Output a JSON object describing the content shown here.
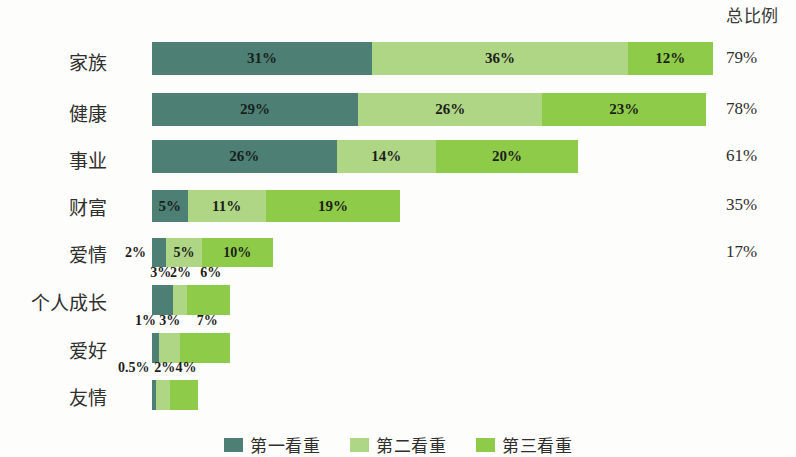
{
  "totals_header": "总比例",
  "colors": {
    "series1": "#4e7f74",
    "series2": "#aed685",
    "series3": "#8ecb49",
    "background": "#fdfdfc",
    "text": "#231f20"
  },
  "legend": [
    {
      "label": "第一看重",
      "color": "#4e7f74"
    },
    {
      "label": "第二看重",
      "color": "#aed685"
    },
    {
      "label": "第三看重",
      "color": "#8ecb49"
    }
  ],
  "rows": [
    {
      "label": "家族",
      "v1": "31%",
      "v2": "36%",
      "v3": "12%",
      "total": "79%",
      "labels_inside": true
    },
    {
      "label": "健康",
      "v1": "29%",
      "v2": "26%",
      "v3": "23%",
      "total": "78%",
      "labels_inside": true
    },
    {
      "label": "事业",
      "v1": "26%",
      "v2": "14%",
      "v3": "20%",
      "total": "61%",
      "labels_inside": true
    },
    {
      "label": "财富",
      "v1": "5%",
      "v2": "11%",
      "v3": "19%",
      "total": "35%",
      "labels_inside": true
    },
    {
      "label": "爱情",
      "v1": "2%",
      "v2": "5%",
      "v3": "10%",
      "total": "17%",
      "labels_inside": false
    },
    {
      "label": "个人成长",
      "v1": "3%",
      "v2": "2%",
      "v3": "6%",
      "total": "",
      "labels_inside": false
    },
    {
      "label": "爱好",
      "v1": "1%",
      "v2": "3%",
      "v3": "7%",
      "total": "",
      "labels_inside": false
    },
    {
      "label": "友情",
      "v1": "0.5%",
      "v2": "2%",
      "v3": "4%",
      "total": "",
      "labels_inside": false
    }
  ],
  "chart_data": {
    "type": "bar",
    "subtype": "stacked-horizontal",
    "title": "",
    "xlabel": "",
    "ylabel": "",
    "grid": false,
    "legend_position": "bottom-center",
    "categories": [
      "家族",
      "健康",
      "事业",
      "财富",
      "爱情",
      "个人成长",
      "爱好",
      "友情"
    ],
    "series": [
      {
        "name": "第一看重",
        "color": "#4e7f74",
        "values": [
          31,
          29,
          26,
          5,
          2,
          3,
          1,
          0.5
        ],
        "value_labels": [
          "31%",
          "29%",
          "26%",
          "5%",
          "2%",
          "3%",
          "1%",
          "0.5%"
        ]
      },
      {
        "name": "第二看重",
        "color": "#aed685",
        "values": [
          36,
          26,
          14,
          11,
          5,
          2,
          3,
          2
        ],
        "value_labels": [
          "36%",
          "26%",
          "14%",
          "11%",
          "5%",
          "2%",
          "3%",
          "2%"
        ]
      },
      {
        "name": "第三看重",
        "color": "#8ecb49",
        "values": [
          12,
          23,
          20,
          19,
          10,
          6,
          7,
          4
        ],
        "value_labels": [
          "12%",
          "23%",
          "20%",
          "19%",
          "10%",
          "6%",
          "7%",
          "4%"
        ]
      }
    ],
    "totals": [
      79,
      78,
      61,
      35,
      17,
      11,
      11,
      6.5
    ],
    "total_labels": [
      "79%",
      "78%",
      "61%",
      "35%",
      "17%",
      "",
      "",
      ""
    ],
    "totals_column_header": "总比例",
    "xlim": [
      0,
      79
    ],
    "units": "percent"
  }
}
